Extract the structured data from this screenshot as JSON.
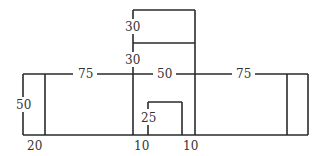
{
  "diagram": {
    "type": "floor-plan-dimension-sketch",
    "line_color": "#2a2a2a",
    "text_color": "#333333",
    "labels": {
      "top_box_height": "30",
      "upper_stem_height": "30",
      "left_width": "75",
      "middle_width": "50",
      "right_width": "75",
      "left_height": "50",
      "small_box_height": "25",
      "bottom_left_offset": "20",
      "bottom_mid_offset_a": "10",
      "bottom_mid_offset_b": "10"
    }
  }
}
